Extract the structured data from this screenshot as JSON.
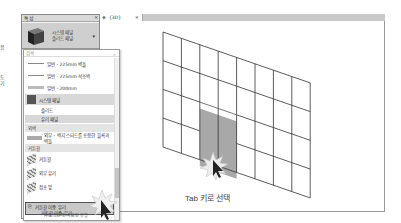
{
  "margin_fragments": [
    "음",
    "도",
    "기"
  ],
  "properties_panel": {
    "title": "특성",
    "close": "×",
    "type_selector": {
      "line1": "시스템 패널",
      "line2": "솔리드 패널",
      "arrow": "▾"
    }
  },
  "type_dropdown": {
    "search_placeholder": "검색",
    "items": [
      {
        "label": "일반 - 225mm 벽돌",
        "kind": "line"
      },
      {
        "label": "일반 - 225mm 석조벽",
        "kind": "line"
      },
      {
        "label": "일반 - 200mm",
        "kind": "line"
      },
      {
        "label": "시스템 패널",
        "kind": "family"
      },
      {
        "label": "솔리드",
        "kind": "type"
      },
      {
        "label": "유리 패널",
        "kind": "type-highlight"
      },
      {
        "label": "외벽",
        "kind": "category"
      },
      {
        "label": "외부 - 벽지 스터드를 포함한 블록과 벽돌",
        "kind": "hatch"
      },
      {
        "label": "커튼월",
        "kind": "category"
      },
      {
        "label": "커튼월",
        "kind": "curtain"
      },
      {
        "label": "외부 유리",
        "kind": "curtain"
      },
      {
        "label": "점포 앞",
        "kind": "curtain"
      },
      {
        "label": "커튼월 이중 유리",
        "kind": "door-family"
      },
      {
        "label": "커튼월 이중 유리",
        "kind": "selected"
      }
    ],
    "footer": "가장 최근에 사용된 유형"
  },
  "view_tab": {
    "icon": "3d-view-icon",
    "label": "{3D}",
    "close": "×"
  },
  "viewport": {
    "grid": {
      "columns": 8,
      "rows": 4,
      "highlight": {
        "col_start": 2,
        "col_end": 4,
        "row_start": 2,
        "row_end": 4
      }
    },
    "highlight_color": "#a8a8a8",
    "callout": "Tab 키로 선택"
  }
}
